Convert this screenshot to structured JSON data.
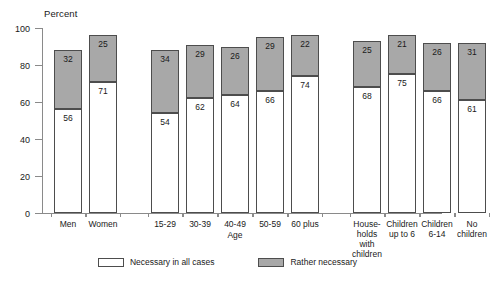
{
  "chart_data": {
    "type": "bar",
    "stacked": true,
    "title": "Percent",
    "xlabel": "",
    "ylabel": "Percent",
    "ylim": [
      0,
      100
    ],
    "yticks": [
      0,
      20,
      40,
      60,
      80,
      100
    ],
    "grid": false,
    "legend_position": "bottom",
    "categories": [
      "Men",
      "Women",
      "15-29",
      "30-39",
      "40-49",
      "50-59",
      "60 plus",
      "House-\nholds\nwith\nchildren",
      "Children\nup to 6",
      "Children\n6-14",
      "No\nchildren"
    ],
    "series": [
      {
        "name": "Necessary in all cases",
        "color": "#ffffff",
        "values": [
          56,
          71,
          54,
          62,
          64,
          66,
          74,
          68,
          75,
          66,
          61
        ]
      },
      {
        "name": "Rather necessary",
        "color": "#a8a8a8",
        "values": [
          32,
          25,
          34,
          29,
          26,
          29,
          22,
          25,
          21,
          26,
          31
        ]
      }
    ],
    "group_captions": [
      {
        "text": "Age",
        "after_category_index": 4
      }
    ]
  },
  "legend": {
    "items": [
      {
        "label": "Necessary in all cases",
        "swatch": "white"
      },
      {
        "label": "Rather necessary",
        "swatch": "gray"
      }
    ]
  }
}
